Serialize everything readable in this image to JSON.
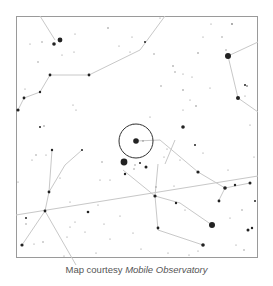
{
  "caption": {
    "prefix": "Map courtesy ",
    "source": "Mobile Observatory"
  },
  "map": {
    "frame": {
      "x": 16,
      "y": 16,
      "w": 242,
      "h": 242
    },
    "colors": {
      "background": "#ffffff",
      "frame": "#9a9a9a",
      "lines": "#c8c8c8",
      "stars": "#222222",
      "circle": "#333333"
    },
    "target_circle": {
      "cx": 136,
      "cy": 141,
      "r": 17
    },
    "ecliptic": {
      "x1": 16,
      "y1": 215,
      "x2": 258,
      "y2": 176
    },
    "constellation_lines": [
      [
        [
          40,
          16
        ],
        [
          55,
          40
        ]
      ],
      [
        [
          50,
          75
        ],
        [
          89,
          75
        ],
        [
          140,
          50
        ],
        [
          165,
          16
        ]
      ],
      [
        [
          50,
          75
        ],
        [
          40,
          92
        ],
        [
          24,
          98
        ],
        [
          18,
          110
        ]
      ],
      [
        [
          228,
          56
        ],
        [
          258,
          42
        ]
      ],
      [
        [
          228,
          56
        ],
        [
          238,
          98
        ],
        [
          258,
          112
        ]
      ],
      [
        [
          136,
          141
        ],
        [
          160,
          140
        ],
        [
          198,
          172
        ],
        [
          225,
          188
        ]
      ],
      [
        [
          225,
          188
        ],
        [
          250,
          183
        ]
      ],
      [
        [
          225,
          188
        ],
        [
          218,
          202
        ]
      ],
      [
        [
          158,
          164
        ],
        [
          155,
          196
        ],
        [
          180,
          203
        ]
      ],
      [
        [
          155,
          196
        ],
        [
          158,
          230
        ],
        [
          203,
          245
        ]
      ],
      [
        [
          180,
          203
        ],
        [
          212,
          225
        ]
      ],
      [
        [
          155,
          196
        ],
        [
          123,
          170
        ]
      ],
      [
        [
          82,
          150
        ],
        [
          65,
          165
        ],
        [
          49,
          192
        ]
      ],
      [
        [
          52,
          150
        ],
        [
          49,
          192
        ]
      ],
      [
        [
          49,
          192
        ],
        [
          45,
          211
        ],
        [
          22,
          245
        ]
      ],
      [
        [
          45,
          211
        ],
        [
          76,
          265
        ]
      ],
      [
        [
          165,
          164
        ],
        [
          175,
          140
        ]
      ]
    ],
    "stars": [
      {
        "x": 60,
        "y": 40,
        "r": 2.4
      },
      {
        "x": 54,
        "y": 44,
        "r": 1.8
      },
      {
        "x": 108,
        "y": 28,
        "r": 0.8
      },
      {
        "x": 75,
        "y": 34,
        "r": 0.6
      },
      {
        "x": 42,
        "y": 42,
        "r": 0.7
      },
      {
        "x": 30,
        "y": 44,
        "r": 0.6
      },
      {
        "x": 62,
        "y": 55,
        "r": 0.6
      },
      {
        "x": 38,
        "y": 62,
        "r": 0.7
      },
      {
        "x": 50,
        "y": 75,
        "r": 1.4
      },
      {
        "x": 89,
        "y": 75,
        "r": 1.4
      },
      {
        "x": 40,
        "y": 92,
        "r": 1.2
      },
      {
        "x": 24,
        "y": 98,
        "r": 1.4
      },
      {
        "x": 18,
        "y": 110,
        "r": 1.6
      },
      {
        "x": 74,
        "y": 52,
        "r": 0.6
      },
      {
        "x": 25,
        "y": 89,
        "r": 0.6
      },
      {
        "x": 76,
        "y": 110,
        "r": 0.6
      },
      {
        "x": 73,
        "y": 105,
        "r": 0.6
      },
      {
        "x": 40,
        "y": 127,
        "r": 1.0
      },
      {
        "x": 44,
        "y": 126,
        "r": 0.8
      },
      {
        "x": 132,
        "y": 37,
        "r": 0.6
      },
      {
        "x": 130,
        "y": 52,
        "r": 0.6
      },
      {
        "x": 119,
        "y": 46,
        "r": 0.6
      },
      {
        "x": 160,
        "y": 18,
        "r": 0.6
      },
      {
        "x": 145,
        "y": 42,
        "r": 1.0
      },
      {
        "x": 154,
        "y": 54,
        "r": 0.7
      },
      {
        "x": 173,
        "y": 66,
        "r": 0.8
      },
      {
        "x": 175,
        "y": 72,
        "r": 0.7
      },
      {
        "x": 183,
        "y": 74,
        "r": 0.6
      },
      {
        "x": 192,
        "y": 77,
        "r": 0.6
      },
      {
        "x": 198,
        "y": 53,
        "r": 0.8
      },
      {
        "x": 211,
        "y": 24,
        "r": 0.6
      },
      {
        "x": 232,
        "y": 24,
        "r": 0.9
      },
      {
        "x": 222,
        "y": 37,
        "r": 0.7
      },
      {
        "x": 203,
        "y": 37,
        "r": 0.6
      },
      {
        "x": 228,
        "y": 56,
        "r": 3.0
      },
      {
        "x": 226,
        "y": 50,
        "r": 0.7
      },
      {
        "x": 245,
        "y": 85,
        "r": 1.0
      },
      {
        "x": 247,
        "y": 86,
        "r": 0.9
      },
      {
        "x": 238,
        "y": 98,
        "r": 2.0
      },
      {
        "x": 245,
        "y": 96,
        "r": 0.6
      },
      {
        "x": 183,
        "y": 90,
        "r": 0.8
      },
      {
        "x": 190,
        "y": 100,
        "r": 0.6
      },
      {
        "x": 161,
        "y": 86,
        "r": 0.7
      },
      {
        "x": 196,
        "y": 106,
        "r": 0.8
      },
      {
        "x": 150,
        "y": 117,
        "r": 0.6
      },
      {
        "x": 183,
        "y": 110,
        "r": 0.6
      },
      {
        "x": 210,
        "y": 88,
        "r": 0.6
      },
      {
        "x": 250,
        "y": 125,
        "r": 0.6
      },
      {
        "x": 183,
        "y": 127,
        "r": 1.8
      },
      {
        "x": 164,
        "y": 157,
        "r": 0.6
      },
      {
        "x": 136,
        "y": 141,
        "r": 2.8
      },
      {
        "x": 143,
        "y": 141,
        "r": 0.8
      },
      {
        "x": 133,
        "y": 124,
        "r": 0.6
      },
      {
        "x": 124,
        "y": 162,
        "r": 3.4
      },
      {
        "x": 140,
        "y": 163,
        "r": 1.0
      },
      {
        "x": 146,
        "y": 167,
        "r": 1.5
      },
      {
        "x": 135,
        "y": 165,
        "r": 0.7
      },
      {
        "x": 125,
        "y": 174,
        "r": 1.2
      },
      {
        "x": 134,
        "y": 169,
        "r": 0.7
      },
      {
        "x": 167,
        "y": 149,
        "r": 0.6
      },
      {
        "x": 156,
        "y": 187,
        "r": 0.7
      },
      {
        "x": 198,
        "y": 172,
        "r": 1.6
      },
      {
        "x": 225,
        "y": 188,
        "r": 1.8
      },
      {
        "x": 235,
        "y": 185,
        "r": 1.2
      },
      {
        "x": 250,
        "y": 183,
        "r": 1.5
      },
      {
        "x": 219,
        "y": 201,
        "r": 1.4
      },
      {
        "x": 155,
        "y": 196,
        "r": 1.6
      },
      {
        "x": 176,
        "y": 203,
        "r": 1.2
      },
      {
        "x": 212,
        "y": 225,
        "r": 3.0
      },
      {
        "x": 158,
        "y": 228,
        "r": 1.4
      },
      {
        "x": 203,
        "y": 245,
        "r": 1.8
      },
      {
        "x": 248,
        "y": 230,
        "r": 1.5
      },
      {
        "x": 252,
        "y": 228,
        "r": 1.2
      },
      {
        "x": 255,
        "y": 201,
        "r": 1.0
      },
      {
        "x": 242,
        "y": 210,
        "r": 0.7
      },
      {
        "x": 230,
        "y": 218,
        "r": 0.6
      },
      {
        "x": 195,
        "y": 145,
        "r": 1.0
      },
      {
        "x": 203,
        "y": 153,
        "r": 0.6
      },
      {
        "x": 180,
        "y": 160,
        "r": 0.6
      },
      {
        "x": 228,
        "y": 170,
        "r": 0.6
      },
      {
        "x": 254,
        "y": 157,
        "r": 0.6
      },
      {
        "x": 174,
        "y": 186,
        "r": 0.6
      },
      {
        "x": 185,
        "y": 210,
        "r": 0.6
      },
      {
        "x": 198,
        "y": 251,
        "r": 0.6
      },
      {
        "x": 189,
        "y": 255,
        "r": 0.6
      },
      {
        "x": 168,
        "y": 253,
        "r": 0.6
      },
      {
        "x": 244,
        "y": 250,
        "r": 0.7
      },
      {
        "x": 236,
        "y": 245,
        "r": 0.6
      },
      {
        "x": 52,
        "y": 150,
        "r": 1.2
      },
      {
        "x": 82,
        "y": 150,
        "r": 1.0
      },
      {
        "x": 49,
        "y": 192,
        "r": 1.4
      },
      {
        "x": 45,
        "y": 211,
        "r": 1.4
      },
      {
        "x": 22,
        "y": 245,
        "r": 1.6
      },
      {
        "x": 36,
        "y": 155,
        "r": 0.7
      },
      {
        "x": 46,
        "y": 155,
        "r": 0.6
      },
      {
        "x": 32,
        "y": 160,
        "r": 0.6
      },
      {
        "x": 102,
        "y": 162,
        "r": 0.7
      },
      {
        "x": 100,
        "y": 180,
        "r": 0.6
      },
      {
        "x": 88,
        "y": 212,
        "r": 1.3
      },
      {
        "x": 75,
        "y": 222,
        "r": 0.6
      },
      {
        "x": 70,
        "y": 227,
        "r": 0.6
      },
      {
        "x": 26,
        "y": 218,
        "r": 1.0
      },
      {
        "x": 26,
        "y": 224,
        "r": 0.7
      },
      {
        "x": 34,
        "y": 244,
        "r": 0.6
      },
      {
        "x": 43,
        "y": 242,
        "r": 0.7
      },
      {
        "x": 67,
        "y": 237,
        "r": 0.6
      },
      {
        "x": 98,
        "y": 205,
        "r": 0.6
      },
      {
        "x": 110,
        "y": 180,
        "r": 0.6
      },
      {
        "x": 18,
        "y": 182,
        "r": 0.6
      },
      {
        "x": 70,
        "y": 202,
        "r": 0.6
      },
      {
        "x": 110,
        "y": 239,
        "r": 0.6
      },
      {
        "x": 120,
        "y": 216,
        "r": 0.6
      },
      {
        "x": 96,
        "y": 253,
        "r": 0.6
      },
      {
        "x": 64,
        "y": 256,
        "r": 0.6
      },
      {
        "x": 133,
        "y": 233,
        "r": 0.6
      },
      {
        "x": 141,
        "y": 249,
        "r": 0.6
      },
      {
        "x": 85,
        "y": 232,
        "r": 0.6
      },
      {
        "x": 104,
        "y": 224,
        "r": 0.6
      },
      {
        "x": 60,
        "y": 178,
        "r": 0.6
      }
    ]
  }
}
